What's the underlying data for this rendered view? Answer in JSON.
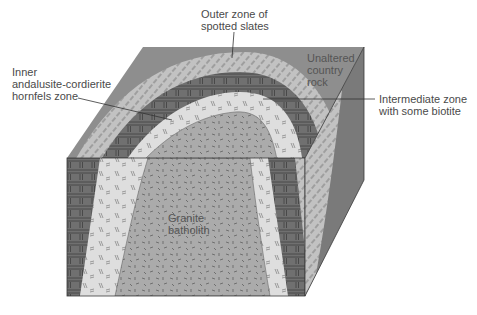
{
  "diagram": {
    "labels": {
      "outer_zone": "Outer zone of\nspotted slates",
      "inner_zone": "Inner\nandalusite-cordierite\nhornfels zone",
      "unaltered": "Unaltered\ncountry\nrock",
      "intermediate_zone": "Intermediate zone\nwith some biotite",
      "granite": "Granite\nbatholith"
    },
    "colors": {
      "country_rock_top": "#8e8e8e",
      "country_rock_side": "#7a7a7a",
      "outer_zone": "#bdbdbd",
      "intermediate_zone": "#6e6e6e",
      "inner_zone": "#dcdcdc",
      "granite": "#a9a9a9",
      "outline": "#3a3a3a",
      "leader_line": "#333333"
    }
  }
}
